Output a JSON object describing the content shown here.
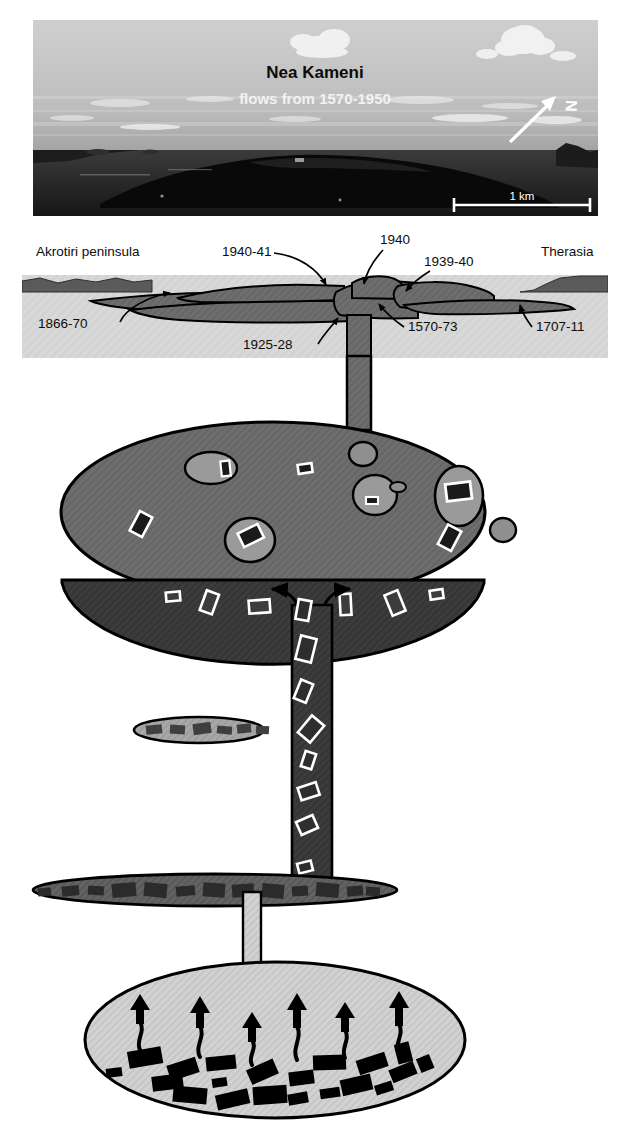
{
  "figure": {
    "name": "nea-kameni-magma-system",
    "width": 630,
    "height": 1130,
    "background": "#ffffff"
  },
  "photo_panel": {
    "title": "Nea Kameni",
    "subtitle": "flows from 1570-1950",
    "scale_bar_label": "1 km",
    "north_label": "N",
    "colors": {
      "sky": "#b9b9b9",
      "sea": "#2a2a2a",
      "island": "#0c0c0c",
      "cloud": "#f4f4f4",
      "title": "#0a0a0a",
      "subtitle": "#f2f2f2"
    },
    "bounds": {
      "x": 33,
      "y": 20,
      "w": 565,
      "h": 196
    }
  },
  "cross_section": {
    "place_labels": [
      {
        "text": "Akrotiri peninsula",
        "x": 36,
        "y": 256
      },
      {
        "text": "Therasia",
        "x": 541,
        "y": 256
      }
    ],
    "flow_labels": [
      {
        "text": "1940-41",
        "x": 222,
        "y": 256
      },
      {
        "text": "1940",
        "x": 380,
        "y": 244
      },
      {
        "text": "1939-40",
        "x": 424,
        "y": 266
      },
      {
        "text": "1866-70",
        "x": 38,
        "y": 328
      },
      {
        "text": "1925-28",
        "x": 243,
        "y": 349
      },
      {
        "text": "1570-73",
        "x": 408,
        "y": 331
      },
      {
        "text": "1707-11",
        "x": 536,
        "y": 331
      }
    ],
    "colors": {
      "panel_background": "#d8d8d8",
      "sky_background": "#ffffff",
      "lava": "#6e6e6e",
      "land": "#5a5a5a",
      "outline": "#000000"
    },
    "bounds": {
      "x": 22,
      "y": 275,
      "w": 586,
      "h": 83
    }
  },
  "magma_system": {
    "conduits": [
      {
        "name": "upper-conduit",
        "x": 347,
        "y": 358,
        "w": 24,
        "h": 68
      },
      {
        "name": "mid-conduit",
        "x": 292,
        "y": 608,
        "w": 40,
        "h": 287
      },
      {
        "name": "lower-conduit",
        "x": 243,
        "y": 895,
        "w": 18,
        "h": 72
      }
    ],
    "chambers": [
      {
        "name": "upper-magma-chamber",
        "cx": 273,
        "cy": 512,
        "rx": 212,
        "ry": 90,
        "fill": "#6e6e6e",
        "band_fill": "#3c3c3c",
        "description": "upper chamber with enclave blobs and plagioclase crystals"
      },
      {
        "name": "mid-sill-lens-small",
        "cx": 199,
        "cy": 730,
        "rx": 65,
        "ry": 13,
        "fill": "#a8a8a8",
        "crystal_fill": "#3f3f3f",
        "crystal_count": 6
      },
      {
        "name": "mid-sill-lens-large",
        "cx": 215,
        "cy": 890,
        "rx": 182,
        "ry": 16,
        "fill": "#636363",
        "crystal_fill": "#2b2b2b",
        "crystal_count": 13
      },
      {
        "name": "lower-magma-chamber",
        "cx": 275,
        "cy": 1040,
        "rx": 190,
        "ry": 78,
        "fill": "#d2d2d2",
        "crystal_fill": "#000000",
        "arrow_count": 6,
        "description": "lower chamber with black crystals and rising volatile arrows"
      }
    ],
    "colors": {
      "conduit_upper": "#6e6e6e",
      "conduit_mid": "#3c3c3c",
      "conduit_lower": "#d2d2d2",
      "crystal_outline": "#ffffff",
      "crystal_dark": "#1a1a1a",
      "enclave": "#9a9a9a",
      "outline": "#000000"
    },
    "convection_arrows": {
      "left": "left-arrow",
      "right": "right-arrow"
    }
  },
  "icons": {
    "north_arrow": "north-arrow-icon",
    "scale_bar": "scale-bar-icon",
    "pointer_arrow": "pointer-arrow-icon",
    "convection_arrow": "convection-arrow-icon",
    "volatile_arrow": "volatile-arrow-icon"
  }
}
